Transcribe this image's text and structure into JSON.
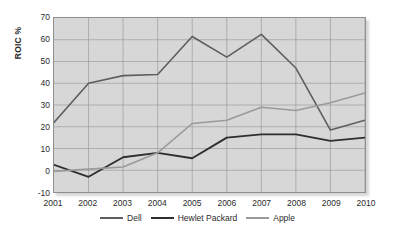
{
  "chart_data": {
    "type": "line",
    "title": "",
    "xlabel": "",
    "ylabel": "ROIC %",
    "x": [
      2001,
      2002,
      2003,
      2004,
      2005,
      2006,
      2007,
      2008,
      2009,
      2010
    ],
    "categories": [
      "2001",
      "2002",
      "2003",
      "2004",
      "2005",
      "2006",
      "2007",
      "2008",
      "2009",
      "2010"
    ],
    "ylim": [
      -10,
      70
    ],
    "yticks": [
      -10,
      0,
      10,
      20,
      30,
      40,
      50,
      60,
      70
    ],
    "ytick_labels": [
      "-10",
      "0",
      "10",
      "20",
      "30",
      "40",
      "50",
      "60",
      "70"
    ],
    "grid": true,
    "legend_position": "bottom",
    "series": [
      {
        "name": "Dell",
        "color": "#5e5e5e",
        "width": 1.6,
        "values": [
          22,
          40,
          43.5,
          44,
          61.5,
          52,
          62.5,
          47,
          18.5,
          23
        ]
      },
      {
        "name": "Hewlet Packard",
        "color": "#2e2e2e",
        "width": 1.9,
        "values": [
          2.5,
          -3,
          6,
          8,
          5.5,
          15,
          16.5,
          16.5,
          13.5,
          15
        ]
      },
      {
        "name": "Apple",
        "color": "#9a9a9a",
        "width": 1.6,
        "values": [
          -0.5,
          0.5,
          1.5,
          8,
          21.5,
          23,
          29,
          27.5,
          31,
          35.5
        ]
      }
    ]
  },
  "style": {
    "plot_background": "#d7d7d7",
    "page_background": "#ffffff",
    "grid_color": "#9b9b9b",
    "frame_color": "#8e8e8e",
    "text_color": "#2b2b2b"
  }
}
